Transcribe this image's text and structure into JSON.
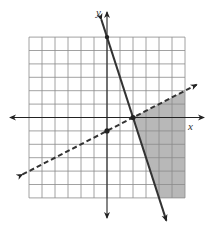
{
  "graph": {
    "type": "system-of-linear-inequalities",
    "x_axis_label": "x",
    "y_axis_label": "y",
    "grid": {
      "x_min": -6,
      "x_max": 6,
      "y_min": -6,
      "y_max": 6,
      "step": 1
    },
    "colors": {
      "grid": "#8a8a8a",
      "axis": "#222222",
      "boundary_line": "#333333",
      "shade": "#b8b8b8"
    },
    "lines": [
      {
        "name": "solid-boundary",
        "style": "solid",
        "equation": "y = -3x + 6",
        "points": [
          [
            0,
            6
          ],
          [
            2,
            0
          ]
        ]
      },
      {
        "name": "dashed-boundary",
        "style": "dashed",
        "equation": "y = x/2 - 1",
        "points": [
          [
            0,
            -1
          ],
          [
            2,
            0
          ]
        ]
      }
    ],
    "points": [
      [
        0,
        -1
      ],
      [
        2,
        0
      ]
    ],
    "shaded_region": [
      [
        2,
        0
      ],
      [
        6,
        2
      ],
      [
        6,
        -6
      ],
      [
        4,
        -6
      ]
    ]
  }
}
